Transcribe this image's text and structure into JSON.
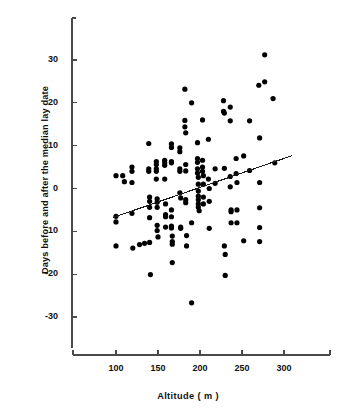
{
  "chart_data": {
    "type": "scatter",
    "title": "",
    "xlabel": "Altitude ( m )",
    "ylabel": "Days before and after the median lay date",
    "xlim": [
      60,
      330
    ],
    "ylim": [
      -38,
      38
    ],
    "xticks": [
      100,
      150,
      200,
      250,
      300
    ],
    "yticks": [
      30,
      20,
      10,
      0,
      -10,
      -20,
      -30
    ],
    "xtick_labels": [
      "100",
      "150",
      "200",
      "250",
      "300"
    ],
    "ytick_labels": [
      "30",
      "20",
      "10",
      "0",
      "-10",
      "-20",
      "-30"
    ],
    "grid": false,
    "legend": "none",
    "marker": "filled-circle",
    "marker_color": "#000000",
    "axis_color": "#4a4a4a",
    "trendline": {
      "label": "regression line",
      "x_start": 96,
      "y_start": -6.8,
      "x_end": 310,
      "y_end": 7.7,
      "color": "#1a1a1a"
    },
    "points": [
      [
        100,
        3.0
      ],
      [
        100,
        -6.5
      ],
      [
        100,
        -7.8
      ],
      [
        100,
        -13.4
      ],
      [
        108,
        3.0
      ],
      [
        110,
        1.6
      ],
      [
        119,
        5.0
      ],
      [
        119,
        4.0
      ],
      [
        119,
        1.4
      ],
      [
        119,
        -5.8
      ],
      [
        120,
        -13.9
      ],
      [
        128,
        -13.1
      ],
      [
        134,
        -12.8
      ],
      [
        139,
        10.5
      ],
      [
        139,
        4.6
      ],
      [
        139,
        4.0
      ],
      [
        140,
        -2.0
      ],
      [
        140,
        -3.0
      ],
      [
        140,
        -4.4
      ],
      [
        140,
        -6.8
      ],
      [
        140,
        -12.6
      ],
      [
        141,
        -20.1
      ],
      [
        148,
        6.3
      ],
      [
        148,
        5.6
      ],
      [
        148,
        4.6
      ],
      [
        148,
        4.0
      ],
      [
        148,
        2.2
      ],
      [
        149,
        -2.4
      ],
      [
        149,
        -3.2
      ],
      [
        149,
        -4.4
      ],
      [
        149,
        -8.6
      ],
      [
        149,
        -9.8
      ],
      [
        150,
        -11.3
      ],
      [
        158,
        6.6
      ],
      [
        158,
        6.0
      ],
      [
        158,
        5.4
      ],
      [
        158,
        2.2
      ],
      [
        159,
        -3.6
      ],
      [
        159,
        -6.1
      ],
      [
        159,
        -6.6
      ],
      [
        159,
        -9.0
      ],
      [
        166,
        10.4
      ],
      [
        166,
        9.6
      ],
      [
        166,
        6.3
      ],
      [
        166,
        6.0
      ],
      [
        166,
        -5.0
      ],
      [
        166,
        -6.6
      ],
      [
        166,
        -8.8
      ],
      [
        166,
        -9.2
      ],
      [
        167,
        -11.1
      ],
      [
        167,
        -12.4
      ],
      [
        167,
        -13.0
      ],
      [
        167,
        -17.3
      ],
      [
        176,
        9.5
      ],
      [
        176,
        8.6
      ],
      [
        176,
        4.0
      ],
      [
        176,
        4.6
      ],
      [
        176,
        -1.0
      ],
      [
        177,
        -2.2
      ],
      [
        177,
        -9.0
      ],
      [
        177,
        -9.3
      ],
      [
        182,
        23.2
      ],
      [
        182,
        15.9
      ],
      [
        182,
        14.4
      ],
      [
        183,
        13.0
      ],
      [
        183,
        5.6
      ],
      [
        183,
        4.1
      ],
      [
        183,
        -2.6
      ],
      [
        183,
        -3.3
      ],
      [
        184,
        -11.0
      ],
      [
        184,
        -13.4
      ],
      [
        190,
        20.0
      ],
      [
        190,
        -8.0
      ],
      [
        190,
        -26.7
      ],
      [
        197,
        10.7
      ],
      [
        197,
        7.0
      ],
      [
        197,
        6.1
      ],
      [
        197,
        4.6
      ],
      [
        197,
        3.6
      ],
      [
        198,
        2.6
      ],
      [
        198,
        1.0
      ],
      [
        198,
        -0.6
      ],
      [
        198,
        -1.8
      ],
      [
        198,
        -2.6
      ],
      [
        198,
        -3.6
      ],
      [
        198,
        -4.4
      ],
      [
        199,
        -5.2
      ],
      [
        203,
        16.0
      ],
      [
        203,
        6.6
      ],
      [
        203,
        5.0
      ],
      [
        203,
        4.0
      ],
      [
        204,
        3.0
      ],
      [
        204,
        1.0
      ],
      [
        204,
        -2.0
      ],
      [
        204,
        -3.6
      ],
      [
        210,
        11.5
      ],
      [
        210,
        2.2
      ],
      [
        211,
        0.0
      ],
      [
        211,
        -3.0
      ],
      [
        211,
        -9.3
      ],
      [
        218,
        4.6
      ],
      [
        218,
        1.2
      ],
      [
        228,
        20.5
      ],
      [
        228,
        18.0
      ],
      [
        229,
        17.6
      ],
      [
        229,
        4.7
      ],
      [
        229,
        -13.4
      ],
      [
        230,
        -15.4
      ],
      [
        230,
        -20.3
      ],
      [
        236,
        19.0
      ],
      [
        236,
        15.8
      ],
      [
        236,
        2.8
      ],
      [
        236,
        0.4
      ],
      [
        237,
        -5.0
      ],
      [
        237,
        -5.4
      ],
      [
        237,
        -8.0
      ],
      [
        243,
        7.0
      ],
      [
        243,
        3.5
      ],
      [
        244,
        1.4
      ],
      [
        244,
        -5.0
      ],
      [
        244,
        -8.0
      ],
      [
        252,
        7.6
      ],
      [
        252,
        -12.2
      ],
      [
        259,
        15.8
      ],
      [
        259,
        4.2
      ],
      [
        270,
        24.1
      ],
      [
        271,
        11.8
      ],
      [
        271,
        1.4
      ],
      [
        271,
        -4.5
      ],
      [
        271,
        -9.1
      ],
      [
        271,
        -12.4
      ],
      [
        277,
        31.2
      ],
      [
        277,
        24.9
      ],
      [
        287,
        21.0
      ],
      [
        289,
        6.0
      ]
    ]
  }
}
